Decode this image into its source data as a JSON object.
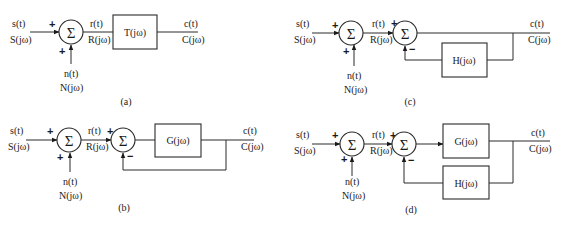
{
  "figure": {
    "colors": {
      "line": "#2a2a2a",
      "text": "#1a1a1a",
      "background": "#ffffff"
    },
    "sum_symbol": "Σ",
    "panels": {
      "a": {
        "caption": "(a)",
        "input_time": "s(t)",
        "input_freq": "S(jω)",
        "noise_time": "n(t)",
        "noise_freq": "N(jω)",
        "mid_time": "r(t)",
        "mid_freq": "R(jω)",
        "output_time": "c(t)",
        "output_freq": "C(jω)",
        "sum1_signs": [
          "+",
          "+"
        ],
        "blocks": [
          "T(jω)"
        ]
      },
      "b": {
        "caption": "(b)",
        "input_time": "s(t)",
        "input_freq": "S(jω)",
        "noise_time": "n(t)",
        "noise_freq": "N(jω)",
        "mid_time": "r(t)",
        "mid_freq": "R(jω)",
        "output_time": "c(t)",
        "output_freq": "C(jω)",
        "sum1_signs": [
          "+",
          "+"
        ],
        "sum2_signs": [
          "+",
          "−"
        ],
        "blocks": [
          "G(jω)"
        ]
      },
      "c": {
        "caption": "(c)",
        "input_time": "s(t)",
        "input_freq": "S(jω)",
        "noise_time": "n(t)",
        "noise_freq": "N(jω)",
        "mid_time": "r(t)",
        "mid_freq": "R(jω)",
        "output_time": "c(t)",
        "output_freq": "C(jω)",
        "sum1_signs": [
          "+",
          "+"
        ],
        "sum2_signs": [
          "+",
          "−"
        ],
        "blocks": [
          "H(jω)"
        ]
      },
      "d": {
        "caption": "(d)",
        "input_time": "s(t)",
        "input_freq": "S(jω)",
        "noise_time": "n(t)",
        "noise_freq": "N(jω)",
        "mid_time": "r(t)",
        "mid_freq": "R(jω)",
        "output_time": "c(t)",
        "output_freq": "C(jω)",
        "sum1_signs": [
          "+",
          "+"
        ],
        "sum2_signs": [
          "+",
          "−"
        ],
        "blocks": [
          "G(jω)",
          "H(jω)"
        ]
      }
    }
  }
}
